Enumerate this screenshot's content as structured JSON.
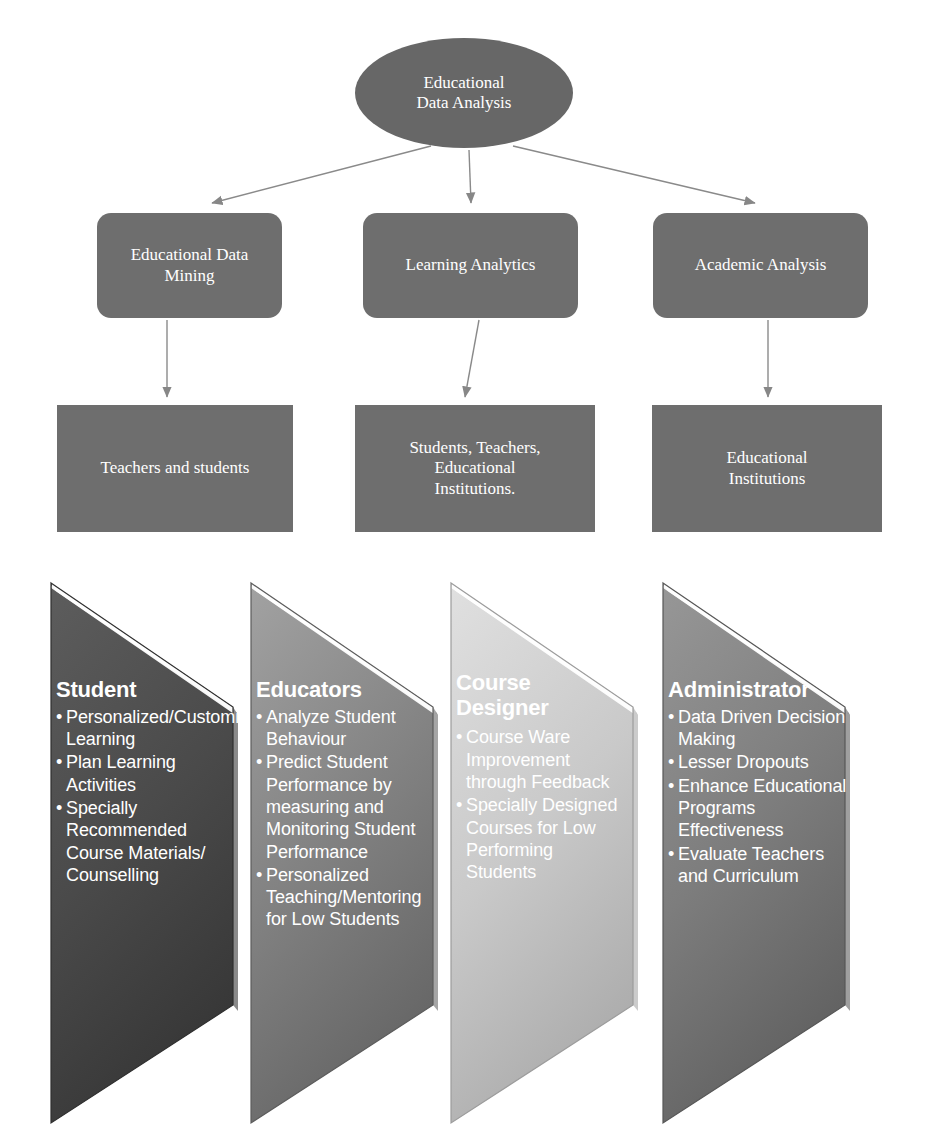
{
  "hierarchy": {
    "root": {
      "label": "Educational\nData Analysis",
      "shape": "ellipse",
      "fill": "#676767"
    },
    "branches": [
      {
        "id": "educational-data-mining",
        "label": "Educational Data\nMining",
        "shape": "rounded-rectangle",
        "fill": "#6e6e6e",
        "target": {
          "id": "teachers-and-students",
          "label": "Teachers and students",
          "shape": "rectangle",
          "fill": "#6e6e6e"
        }
      },
      {
        "id": "learning-analytics",
        "label": "Learning Analytics",
        "shape": "rounded-rectangle",
        "fill": "#6e6e6e",
        "target": {
          "id": "students-teachers-institutions",
          "label": "Students, Teachers,\nEducational\nInstitutions.",
          "shape": "rectangle",
          "fill": "#6e6e6e"
        }
      },
      {
        "id": "academic-analysis",
        "label": "Academic Analysis",
        "shape": "rounded-rectangle",
        "fill": "#6e6e6e",
        "target": {
          "id": "educational-institutions",
          "label": "Educational\nInstitutions",
          "shape": "rectangle",
          "fill": "#6e6e6e"
        }
      }
    ]
  },
  "stakeholder_panels": [
    {
      "id": "student",
      "title": "Student",
      "fill_top": "#5a5a5a",
      "fill_bottom": "#3f3f3f",
      "items": [
        "Personalized/Customized Learning",
        "Plan Learning Activities",
        "Specially Recommended Course Materials/ Counselling"
      ]
    },
    {
      "id": "educators",
      "title": "Educators",
      "fill_top": "#9a9a9a",
      "fill_bottom": "#6f6f6f",
      "items": [
        "Analyze Student Behaviour",
        "Predict Student Performance by measuring and Monitoring Student Performance",
        "Personalized Teaching/Mentoring for Low Students"
      ]
    },
    {
      "id": "course-designer",
      "title": "Course Designer",
      "fill_top": "#d9d9d9",
      "fill_bottom": "#b4b4b4",
      "items": [
        "Course Ware Improvement through Feedback",
        "Specially Designed Courses for Low Performing Students"
      ]
    },
    {
      "id": "administrator",
      "title": "Administrator",
      "fill_top": "#8d8d8d",
      "fill_bottom": "#6a6a6a",
      "items": [
        "Data Driven Decision Making",
        "Lesser Dropouts",
        "Enhance Educational Programs Effectiveness",
        "Evaluate Teachers and Curriculum"
      ]
    }
  ],
  "connectors": {
    "stroke": "#808080",
    "count": 6
  }
}
